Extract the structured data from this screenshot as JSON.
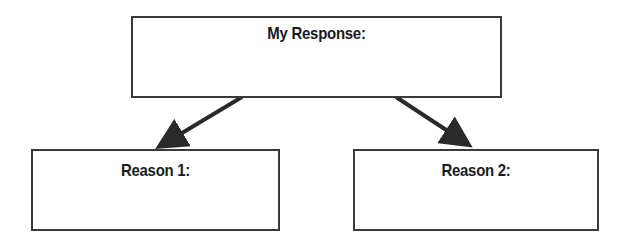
{
  "diagram": {
    "top_box": {
      "label": "My Response:"
    },
    "left_box": {
      "label": "Reason 1:"
    },
    "right_box": {
      "label": "Reason 2:"
    },
    "arrows": [
      {
        "from": "top_box",
        "to": "left_box"
      },
      {
        "from": "top_box",
        "to": "right_box"
      }
    ],
    "colors": {
      "line": "#3a3a3a",
      "text": "#1a1a1a",
      "background": "#ffffff"
    }
  }
}
